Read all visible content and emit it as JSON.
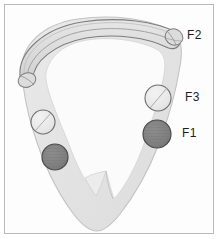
{
  "figure": {
    "background_color": "#fdfdfd",
    "frame_color": "#b9b9b9",
    "wall_fill": "#e4e4e4",
    "wall_stroke": "#bdbdbd",
    "cavity_fill": "#fbfbfb",
    "band_fill": "#dedede",
    "band_stroke": "#7d7d7d",
    "marker_dark_fill": "#808080",
    "marker_dark_stroke": "#4a4a4a",
    "marker_light_fill": "#e8e8e8",
    "marker_light_stroke": "#6e6e6e"
  },
  "labels": [
    {
      "id": "f2",
      "text": "F2",
      "x": 187,
      "y": 29,
      "target": "arch-band-right-end"
    },
    {
      "id": "f3",
      "text": "F3",
      "x": 185,
      "y": 91,
      "target": "marker-light-right"
    },
    {
      "id": "f1",
      "text": "F1",
      "x": 182,
      "y": 127,
      "target": "marker-dark-right"
    }
  ],
  "markers": [
    {
      "id": "marker-light-right",
      "label": "F3",
      "shade": "light",
      "cx": 158,
      "cy": 98,
      "r": 13
    },
    {
      "id": "marker-dark-right",
      "label": "F1",
      "shade": "dark",
      "cx": 157,
      "cy": 134,
      "r": 14
    },
    {
      "id": "marker-light-left",
      "label": "",
      "shade": "light",
      "cx": 43,
      "cy": 122,
      "r": 12
    },
    {
      "id": "marker-dark-left",
      "label": "",
      "shade": "dark",
      "cx": 55,
      "cy": 157,
      "r": 13
    }
  ],
  "parts": [
    {
      "id": "ventricular-wall",
      "name": "ventricular wall outline"
    },
    {
      "id": "arch-band",
      "name": "curved arch band"
    },
    {
      "id": "septum-notch",
      "name": "septal V notch"
    }
  ]
}
